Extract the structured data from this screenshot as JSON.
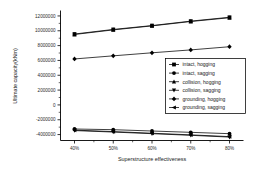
{
  "chart_data": {
    "type": "line",
    "title": "",
    "xlabel": "Superstructure effectiveness",
    "ylabel": "Ultimate capacity(kNm)",
    "categories": [
      "40%",
      "50%",
      "60%",
      "70%",
      "80%"
    ],
    "x_tick_labels": [
      "40%",
      "50%",
      "60%",
      "70%",
      "80%"
    ],
    "y_tick_labels": [
      "12000000",
      "10000000",
      "8000000",
      "6000000",
      "4000000",
      "2000000",
      "0",
      "-2000000",
      "-4000000"
    ],
    "y_tick_values": [
      12000000,
      10000000,
      8000000,
      6000000,
      4000000,
      2000000,
      0,
      -2000000,
      -4000000
    ],
    "ylim": [
      -4800000,
      12600000
    ],
    "grid": false,
    "legend_position": "center-right",
    "series": [
      {
        "name": "intact, hogging",
        "marker": "square",
        "color": "#000000",
        "values": [
          9560000,
          10180000,
          10700000,
          11300000,
          11820000
        ]
      },
      {
        "name": "intact, sagging",
        "marker": "circle",
        "color": "#000000",
        "values": [
          -3250000,
          -3340000,
          -3520000,
          -3700000,
          -3880000
        ]
      },
      {
        "name": "collision, hogging",
        "marker": "triangle-up",
        "color": "#000000",
        "values": [
          9500000,
          10120000,
          10660000,
          11250000,
          11760000
        ]
      },
      {
        "name": "collision, sagging",
        "marker": "triangle-down",
        "color": "#000000",
        "values": [
          -3460000,
          -3660000,
          -3880000,
          -4100000,
          -4340000
        ]
      },
      {
        "name": "grounding, hogging",
        "marker": "diamond",
        "color": "#000000",
        "values": [
          6200000,
          6620000,
          7030000,
          7420000,
          7850000
        ]
      },
      {
        "name": "grounding, sagging",
        "marker": "left-triangle",
        "color": "#000000",
        "values": [
          -3400000,
          -3600000,
          -3820000,
          -4040000,
          -4280000
        ]
      }
    ]
  },
  "legend": {
    "entries": [
      {
        "label": "intact, hogging"
      },
      {
        "label": "intact, sagging"
      },
      {
        "label": "collision, hogging"
      },
      {
        "label": "collision, sagging"
      },
      {
        "label": "grounding, hogging"
      },
      {
        "label": "grounding, sagging"
      }
    ]
  }
}
